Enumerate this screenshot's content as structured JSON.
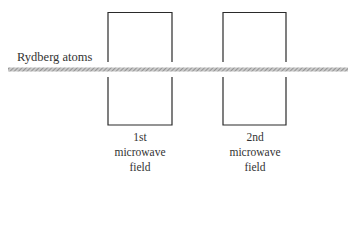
{
  "diagram": {
    "beam": {
      "label": "Rydberg atoms",
      "color": "#9a9a9a"
    },
    "fields": [
      {
        "line1": "1st",
        "line2": "microwave",
        "line3": "field"
      },
      {
        "line1": "2nd",
        "line2": "microwave",
        "line3": "field"
      }
    ],
    "stroke_color": "#2a2a2a"
  }
}
